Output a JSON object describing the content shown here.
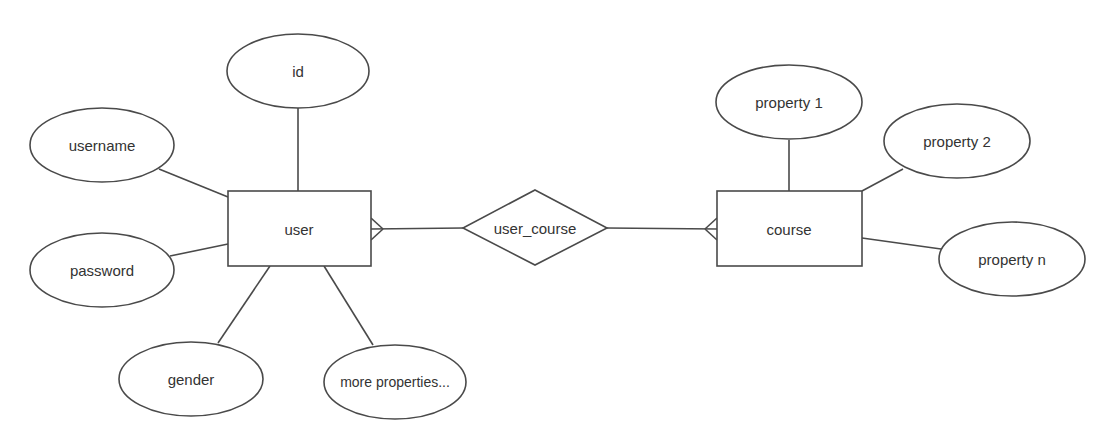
{
  "diagram": {
    "type": "er-diagram",
    "colors": {
      "stroke": "#4a4a4a",
      "text": "#333333",
      "background": "#ffffff"
    },
    "entities": [
      {
        "id": "user",
        "label": "user"
      },
      {
        "id": "course",
        "label": "course"
      }
    ],
    "relationships": [
      {
        "id": "user_course",
        "label": "user_course",
        "connects": [
          "user",
          "course"
        ],
        "cardinality": "many-to-many"
      }
    ],
    "attributes": {
      "user": [
        {
          "id": "id",
          "label": "id"
        },
        {
          "id": "username",
          "label": "username"
        },
        {
          "id": "password",
          "label": "password"
        },
        {
          "id": "gender",
          "label": "gender"
        },
        {
          "id": "more",
          "label": "more properties..."
        }
      ],
      "course": [
        {
          "id": "p1",
          "label": "property 1"
        },
        {
          "id": "p2",
          "label": "property 2"
        },
        {
          "id": "pn",
          "label": "property n"
        }
      ]
    }
  }
}
